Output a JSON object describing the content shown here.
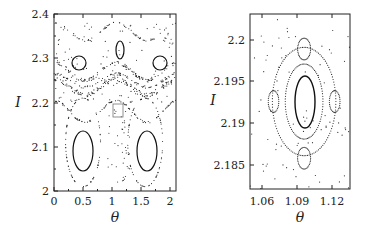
{
  "chart_data": [
    {
      "type": "scatter",
      "title": "",
      "xlabel": "θ",
      "ylabel": "I",
      "xlim": [
        0,
        2.1
      ],
      "ylim": [
        2.0,
        2.4
      ],
      "xticks": [
        "0",
        "0.5",
        "1",
        "1.5",
        "2"
      ],
      "yticks": [
        "2",
        "2.1",
        "2.2",
        "2.3",
        "2.4"
      ],
      "grid": false,
      "legend": null,
      "description": "Poincaré section (phase portrait): two large islands centered near (0.5, 2.11) and (1.57, 2.11); three small islands near (0.43, 2.30), (1.15, 2.33), (1.85, 2.30); chaotic layer near I≈2.22-2.26; small inset rectangle near θ≈1.07-1.14, I≈2.17-2.20",
      "features": [
        {
          "kind": "island",
          "center": [
            0.5,
            2.11
          ],
          "half_width": 0.13,
          "half_height": 0.065
        },
        {
          "kind": "island",
          "center": [
            1.57,
            2.11
          ],
          "half_width": 0.13,
          "half_height": 0.065
        },
        {
          "kind": "island",
          "center": [
            0.43,
            2.3
          ],
          "half_width": 0.1,
          "half_height": 0.02
        },
        {
          "kind": "island",
          "center": [
            1.15,
            2.33
          ],
          "half_width": 0.05,
          "half_height": 0.03
        },
        {
          "kind": "island",
          "center": [
            1.85,
            2.3
          ],
          "half_width": 0.1,
          "half_height": 0.02
        },
        {
          "kind": "inset_box",
          "x": [
            1.07,
            1.14
          ],
          "y": [
            2.172,
            2.205
          ]
        }
      ]
    },
    {
      "type": "scatter",
      "title": "",
      "xlabel": "θ",
      "ylabel": "I",
      "xlim": [
        1.05,
        1.135
      ],
      "ylim": [
        2.182,
        2.203
      ],
      "xticks": [
        "1.06",
        "1.09",
        "1.12"
      ],
      "yticks": [
        "2.185",
        "2.19",
        "2.195",
        "2.2"
      ],
      "grid": false,
      "legend": null,
      "description": "Zoom of inset: central island at (1.095, 2.1925) surrounded by four satellite islands (top, bottom, left, right) with separatrix chain",
      "features": [
        {
          "kind": "island",
          "center": [
            1.095,
            2.1925
          ],
          "half_width": 0.0075,
          "half_height": 0.0028
        },
        {
          "kind": "island",
          "center": [
            1.096,
            2.1988
          ],
          "half_width": 0.006,
          "half_height": 0.0012
        },
        {
          "kind": "island",
          "center": [
            1.096,
            2.1855
          ],
          "half_width": 0.006,
          "half_height": 0.0012
        },
        {
          "kind": "island",
          "center": [
            1.07,
            2.1925
          ],
          "half_width": 0.005,
          "half_height": 0.0012
        },
        {
          "kind": "island",
          "center": [
            1.122,
            2.1925
          ],
          "half_width": 0.005,
          "half_height": 0.0012
        }
      ]
    }
  ],
  "left_plot": {
    "xlabel": "θ",
    "ylabel": "I",
    "xticks": [
      "0",
      "0.5",
      "1",
      "1.5",
      "2"
    ],
    "yticks": [
      "2",
      "2.1",
      "2.2",
      "2.3",
      "2.4"
    ]
  },
  "right_plot": {
    "xlabel": "θ",
    "ylabel": "I",
    "xticks": [
      "1.06",
      "1.09",
      "1.12"
    ],
    "yticks": [
      "2.185",
      "2.19",
      "2.195",
      "2.2"
    ]
  }
}
